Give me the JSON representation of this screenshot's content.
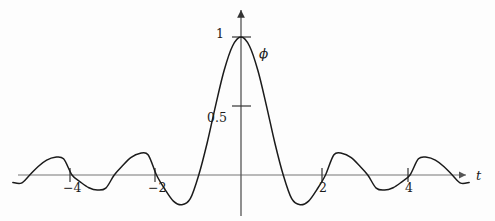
{
  "figure": {
    "name": "scaling-function-plot",
    "background_color": "#fdfdfd",
    "curve_color": "#1b1b1b",
    "axis_color": "#666666",
    "text_color": "#1b1b1b"
  },
  "labels": {
    "y_tick_1": "1",
    "y_tick_05": "0.5",
    "x_tick_m4": "−4",
    "x_tick_m2": "−2",
    "x_tick_2": "2",
    "x_tick_4": "4",
    "x_axis": "t",
    "curve": "ϕ"
  },
  "chart_data": {
    "type": "line",
    "title": "",
    "xlabel": "t",
    "ylabel": "ϕ",
    "series": [
      {
        "name": "ϕ",
        "function": "sinc-like scaling function, ϕ(t) = sin(πt)/(πt)",
        "x": [
          -5.4,
          -5.2,
          -5.0,
          -4.8,
          -4.6,
          -4.4,
          -4.2,
          -4.0,
          -3.8,
          -3.6,
          -3.4,
          -3.2,
          -3.0,
          -2.8,
          -2.6,
          -2.4,
          -2.2,
          -2.0,
          -1.8,
          -1.6,
          -1.4,
          -1.2,
          -1.0,
          -0.8,
          -0.6,
          -0.4,
          -0.2,
          0.0,
          0.2,
          0.4,
          0.6,
          0.8,
          1.0,
          1.2,
          1.4,
          1.6,
          1.8,
          2.0,
          2.2,
          2.4,
          2.6,
          2.8,
          3.0,
          3.2,
          3.4,
          3.6,
          3.8,
          4.0,
          4.2,
          4.4,
          4.6,
          4.8,
          5.0,
          5.2,
          5.4
        ],
        "y": [
          -0.054,
          -0.059,
          0.0,
          0.062,
          0.108,
          0.129,
          0.117,
          0.0,
          -0.051,
          -0.092,
          -0.109,
          -0.095,
          0.0,
          0.069,
          0.127,
          0.156,
          0.147,
          0.0,
          -0.104,
          -0.189,
          -0.216,
          -0.172,
          0.0,
          0.234,
          0.505,
          0.757,
          0.935,
          1.0,
          0.935,
          0.757,
          0.505,
          0.234,
          0.0,
          -0.172,
          -0.216,
          -0.189,
          -0.104,
          0.0,
          0.147,
          0.156,
          0.127,
          0.069,
          0.0,
          -0.095,
          -0.109,
          -0.092,
          -0.051,
          0.0,
          0.117,
          0.129,
          0.108,
          0.062,
          0.0,
          -0.059,
          -0.054
        ]
      }
    ],
    "x_ticks": [
      -4,
      -2,
      2,
      4
    ],
    "x_tick_labels": [
      "−4",
      "−2",
      "2",
      "4"
    ],
    "y_ticks": [
      0.5,
      1
    ],
    "y_tick_labels": [
      "0.5",
      "1"
    ],
    "xlim": [
      -5.4,
      5.4
    ],
    "ylim": [
      -0.28,
      1.1
    ],
    "grid": false,
    "legend": "none",
    "axes_arrows": true
  }
}
